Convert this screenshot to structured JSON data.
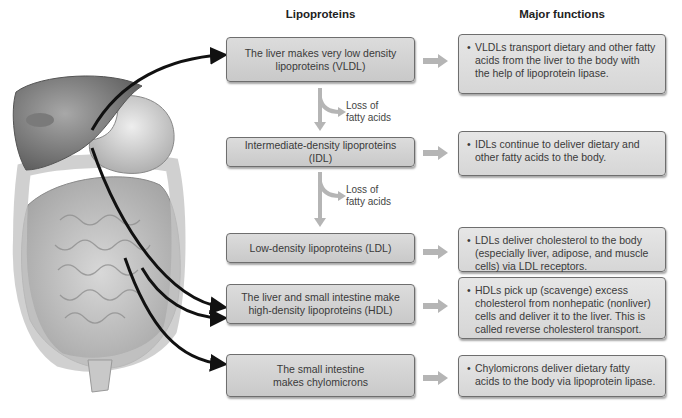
{
  "headers": {
    "lipoproteins": "Lipoproteins",
    "major_functions": "Major functions"
  },
  "lipoproteins": [
    {
      "id": "vldl",
      "text": "The liver makes very low density lipoproteins (VLDL)"
    },
    {
      "id": "idl",
      "text": "Intermediate-density lipoproteins (IDL)"
    },
    {
      "id": "ldl",
      "text": "Low-density lipoproteins (LDL)"
    },
    {
      "id": "hdl",
      "text": "The liver and small intestine make high-density lipoproteins (HDL)"
    },
    {
      "id": "chylomicrons",
      "text": "The small intestine makes chylomicrons"
    }
  ],
  "functions": [
    {
      "id": "vldl",
      "bullet": "•",
      "text": "VLDLs transport dietary and other fatty acids from the liver to the body with the help of lipoprotein lipase."
    },
    {
      "id": "idl",
      "bullet": "•",
      "text": "IDLs continue to deliver dietary and other fatty acids to the body."
    },
    {
      "id": "ldl",
      "bullet": "•",
      "text": "LDLs deliver cholesterol to the body (especially liver, adipose, and muscle cells) via LDL receptors."
    },
    {
      "id": "hdl",
      "bullet": "•",
      "text": "HDLs pick up (scavenge) excess cholesterol from nonhepatic (nonliver) cells and deliver it to the liver. This is called reverse cholesterol transport."
    },
    {
      "id": "chylomicrons",
      "bullet": "•",
      "text": "Chylomicrons deliver dietary fatty acids to the body via lipoprotein lipase."
    }
  ],
  "conversions": [
    {
      "label_line1": "Loss of",
      "label_line2": "fatty acids"
    },
    {
      "label_line1": "Loss of",
      "label_line2": "fatty acids"
    }
  ],
  "illustration": {
    "label": "Liver, stomach and intestines illustration"
  },
  "colors": {
    "box_fill": "#d2d2d2",
    "box_border": "#6e6e6e",
    "arrow_gray": "#b5b5b5",
    "arrow_black": "#111111"
  }
}
